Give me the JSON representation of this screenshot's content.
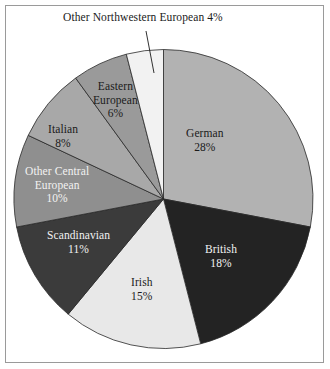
{
  "figure": {
    "background_color": "#ffffff",
    "frame_color": "#9a9a9a"
  },
  "callouts": [
    {
      "name": "other-northwestern-european",
      "text": "Other Northwestern European 4%"
    }
  ],
  "chart_data": {
    "type": "pie",
    "title": "",
    "subtitle": "",
    "xlabel": "",
    "ylabel": "",
    "legend_position": "none",
    "grid": false,
    "start_angle_deg": 0,
    "direction": "clockwise",
    "units": "percent",
    "total": 100,
    "categories": [
      "German",
      "British",
      "Irish",
      "Scandinavian",
      "Other Central European",
      "Italian",
      "Eastern European",
      "Other Northwestern European"
    ],
    "values": [
      28,
      18,
      15,
      11,
      10,
      8,
      6,
      4
    ],
    "colors": [
      "#b2b2b2",
      "#232323",
      "#e8e8e8",
      "#3b3b3b",
      "#8f8f8f",
      "#a8a8a8",
      "#9a9a9a",
      "#f2f2f2"
    ],
    "slices": [
      {
        "name": "german",
        "label": "German",
        "value": 28,
        "pct_text": "28%",
        "color": "#b2b2b2",
        "label_color": "dark",
        "label_placement": "inside"
      },
      {
        "name": "british",
        "label": "British",
        "value": 18,
        "pct_text": "18%",
        "color": "#232323",
        "label_color": "light",
        "label_placement": "inside"
      },
      {
        "name": "irish",
        "label": "Irish",
        "value": 15,
        "pct_text": "15%",
        "color": "#e8e8e8",
        "label_color": "dark",
        "label_placement": "inside"
      },
      {
        "name": "scandinavian",
        "label": "Scandinavian",
        "value": 11,
        "pct_text": "11%",
        "color": "#3b3b3b",
        "label_color": "light",
        "label_placement": "inside"
      },
      {
        "name": "other-central-european",
        "label": "Other Central",
        "label_line2": "European",
        "value": 10,
        "pct_text": "10%",
        "color": "#8f8f8f",
        "label_color": "light",
        "label_placement": "inside"
      },
      {
        "name": "italian",
        "label": "Italian",
        "value": 8,
        "pct_text": "8%",
        "color": "#a8a8a8",
        "label_color": "dark",
        "label_placement": "inside"
      },
      {
        "name": "eastern-european",
        "label": "Eastern",
        "label_line2": "European",
        "value": 6,
        "pct_text": "6%",
        "color": "#9a9a9a",
        "label_color": "dark",
        "label_placement": "inside"
      },
      {
        "name": "other-northwestern-european",
        "label": "Other Northwestern European",
        "value": 4,
        "pct_text": "4%",
        "color": "#f2f2f2",
        "label_color": "dark",
        "label_placement": "callout"
      }
    ]
  }
}
